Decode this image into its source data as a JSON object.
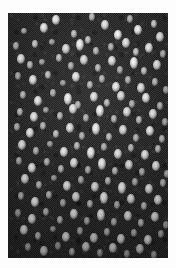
{
  "figure": {
    "kind": "micrograph",
    "caption": "",
    "canvas": {
      "width": 176,
      "height": 268
    },
    "page_background": "#fdfdfd",
    "field": {
      "x": 8,
      "y": 13,
      "width": 160,
      "height": 245,
      "background_color": "#242424",
      "texture": "dithered-halftone",
      "particle_color": "#ffffff",
      "particle_count": 152,
      "description": "Dark field scattered with small bright elliptical particles"
    }
  },
  "chart_data": {
    "type": "scatter",
    "title": "",
    "xlabel": "",
    "ylabel": "",
    "xlim": [
      0,
      160
    ],
    "ylim": [
      0,
      245
    ],
    "grid": false,
    "legend": null,
    "background": "#242424",
    "marker_color": "#ffffff",
    "note": "Positions are pixel coordinates within the dark imaged field; size is particle diameter in px; b is relative brightness 0-1.",
    "points": [
      {
        "x": 48,
        "y": 7,
        "w": 4,
        "h": 5,
        "b": 0.92
      },
      {
        "x": 84,
        "y": 4,
        "w": 3,
        "h": 4,
        "b": 0.7
      },
      {
        "x": 122,
        "y": 6,
        "w": 3,
        "h": 4,
        "b": 0.66
      },
      {
        "x": 16,
        "y": 18,
        "w": 3,
        "h": 3,
        "b": 0.62
      },
      {
        "x": 36,
        "y": 15,
        "w": 4,
        "h": 5,
        "b": 0.9
      },
      {
        "x": 66,
        "y": 21,
        "w": 3,
        "h": 4,
        "b": 0.72
      },
      {
        "x": 97,
        "y": 12,
        "w": 4,
        "h": 5,
        "b": 0.88
      },
      {
        "x": 110,
        "y": 22,
        "w": 4,
        "h": 5,
        "b": 0.95
      },
      {
        "x": 130,
        "y": 17,
        "w": 4,
        "h": 5,
        "b": 0.93
      },
      {
        "x": 146,
        "y": 11,
        "w": 3,
        "h": 4,
        "b": 0.76
      },
      {
        "x": 152,
        "y": 24,
        "w": 4,
        "h": 5,
        "b": 0.9
      },
      {
        "x": 8,
        "y": 33,
        "w": 3,
        "h": 4,
        "b": 0.68
      },
      {
        "x": 27,
        "y": 31,
        "w": 3,
        "h": 4,
        "b": 0.74
      },
      {
        "x": 44,
        "y": 29,
        "w": 3,
        "h": 3,
        "b": 0.58
      },
      {
        "x": 58,
        "y": 36,
        "w": 4,
        "h": 5,
        "b": 0.86
      },
      {
        "x": 72,
        "y": 32,
        "w": 4,
        "h": 6,
        "b": 0.94
      },
      {
        "x": 80,
        "y": 27,
        "w": 3,
        "h": 4,
        "b": 0.72
      },
      {
        "x": 88,
        "y": 38,
        "w": 3,
        "h": 4,
        "b": 0.7
      },
      {
        "x": 103,
        "y": 34,
        "w": 3,
        "h": 4,
        "b": 0.66
      },
      {
        "x": 118,
        "y": 30,
        "w": 4,
        "h": 5,
        "b": 0.88
      },
      {
        "x": 128,
        "y": 39,
        "w": 3,
        "h": 4,
        "b": 0.74
      },
      {
        "x": 141,
        "y": 35,
        "w": 4,
        "h": 5,
        "b": 0.9
      },
      {
        "x": 155,
        "y": 41,
        "w": 3,
        "h": 4,
        "b": 0.68
      },
      {
        "x": 13,
        "y": 46,
        "w": 4,
        "h": 5,
        "b": 0.92
      },
      {
        "x": 22,
        "y": 52,
        "w": 3,
        "h": 4,
        "b": 0.7
      },
      {
        "x": 34,
        "y": 49,
        "w": 3,
        "h": 3,
        "b": 0.6
      },
      {
        "x": 51,
        "y": 45,
        "w": 3,
        "h": 4,
        "b": 0.72
      },
      {
        "x": 63,
        "y": 53,
        "w": 3,
        "h": 4,
        "b": 0.66
      },
      {
        "x": 76,
        "y": 47,
        "w": 4,
        "h": 5,
        "b": 0.86
      },
      {
        "x": 90,
        "y": 55,
        "w": 3,
        "h": 4,
        "b": 0.7
      },
      {
        "x": 104,
        "y": 48,
        "w": 4,
        "h": 5,
        "b": 0.88
      },
      {
        "x": 112,
        "y": 57,
        "w": 3,
        "h": 4,
        "b": 0.64
      },
      {
        "x": 126,
        "y": 50,
        "w": 4,
        "h": 6,
        "b": 0.95
      },
      {
        "x": 136,
        "y": 58,
        "w": 3,
        "h": 4,
        "b": 0.72
      },
      {
        "x": 149,
        "y": 52,
        "w": 4,
        "h": 5,
        "b": 0.9
      },
      {
        "x": 10,
        "y": 63,
        "w": 3,
        "h": 4,
        "b": 0.66
      },
      {
        "x": 25,
        "y": 67,
        "w": 4,
        "h": 5,
        "b": 0.88
      },
      {
        "x": 40,
        "y": 62,
        "w": 3,
        "h": 4,
        "b": 0.72
      },
      {
        "x": 55,
        "y": 70,
        "w": 3,
        "h": 3,
        "b": 0.58
      },
      {
        "x": 68,
        "y": 64,
        "w": 4,
        "h": 5,
        "b": 0.9
      },
      {
        "x": 82,
        "y": 72,
        "w": 3,
        "h": 4,
        "b": 0.7
      },
      {
        "x": 94,
        "y": 66,
        "w": 3,
        "h": 4,
        "b": 0.68
      },
      {
        "x": 108,
        "y": 74,
        "w": 4,
        "h": 5,
        "b": 0.92
      },
      {
        "x": 120,
        "y": 67,
        "w": 3,
        "h": 4,
        "b": 0.66
      },
      {
        "x": 133,
        "y": 75,
        "w": 4,
        "h": 5,
        "b": 0.86
      },
      {
        "x": 147,
        "y": 69,
        "w": 3,
        "h": 4,
        "b": 0.7
      },
      {
        "x": 158,
        "y": 77,
        "w": 3,
        "h": 4,
        "b": 0.64
      },
      {
        "x": 15,
        "y": 82,
        "w": 3,
        "h": 4,
        "b": 0.7
      },
      {
        "x": 30,
        "y": 88,
        "w": 4,
        "h": 5,
        "b": 0.9
      },
      {
        "x": 45,
        "y": 80,
        "w": 3,
        "h": 4,
        "b": 0.66
      },
      {
        "x": 60,
        "y": 86,
        "w": 4,
        "h": 6,
        "b": 0.94
      },
      {
        "x": 70,
        "y": 92,
        "w": 3,
        "h": 4,
        "b": 0.68
      },
      {
        "x": 86,
        "y": 84,
        "w": 4,
        "h": 5,
        "b": 0.88
      },
      {
        "x": 99,
        "y": 90,
        "w": 3,
        "h": 4,
        "b": 0.7
      },
      {
        "x": 113,
        "y": 83,
        "w": 4,
        "h": 5,
        "b": 0.86
      },
      {
        "x": 124,
        "y": 91,
        "w": 3,
        "h": 4,
        "b": 0.64
      },
      {
        "x": 138,
        "y": 85,
        "w": 4,
        "h": 5,
        "b": 0.9
      },
      {
        "x": 152,
        "y": 93,
        "w": 3,
        "h": 4,
        "b": 0.68
      },
      {
        "x": 12,
        "y": 99,
        "w": 3,
        "h": 4,
        "b": 0.72
      },
      {
        "x": 26,
        "y": 104,
        "w": 4,
        "h": 5,
        "b": 0.88
      },
      {
        "x": 38,
        "y": 97,
        "w": 3,
        "h": 3,
        "b": 0.58
      },
      {
        "x": 52,
        "y": 103,
        "w": 3,
        "h": 4,
        "b": 0.7
      },
      {
        "x": 65,
        "y": 96,
        "w": 4,
        "h": 5,
        "b": 0.9
      },
      {
        "x": 78,
        "y": 105,
        "w": 3,
        "h": 4,
        "b": 0.66
      },
      {
        "x": 92,
        "y": 98,
        "w": 4,
        "h": 6,
        "b": 0.95
      },
      {
        "x": 106,
        "y": 106,
        "w": 3,
        "h": 4,
        "b": 0.68
      },
      {
        "x": 119,
        "y": 99,
        "w": 4,
        "h": 5,
        "b": 0.86
      },
      {
        "x": 131,
        "y": 107,
        "w": 3,
        "h": 4,
        "b": 0.7
      },
      {
        "x": 145,
        "y": 101,
        "w": 4,
        "h": 5,
        "b": 0.88
      },
      {
        "x": 157,
        "y": 109,
        "w": 3,
        "h": 4,
        "b": 0.62
      },
      {
        "x": 9,
        "y": 114,
        "w": 3,
        "h": 4,
        "b": 0.66
      },
      {
        "x": 22,
        "y": 120,
        "w": 4,
        "h": 5,
        "b": 0.9
      },
      {
        "x": 35,
        "y": 113,
        "w": 3,
        "h": 4,
        "b": 0.68
      },
      {
        "x": 48,
        "y": 121,
        "w": 3,
        "h": 4,
        "b": 0.72
      },
      {
        "x": 62,
        "y": 115,
        "w": 4,
        "h": 5,
        "b": 0.88
      },
      {
        "x": 74,
        "y": 123,
        "w": 3,
        "h": 4,
        "b": 0.64
      },
      {
        "x": 88,
        "y": 116,
        "w": 4,
        "h": 6,
        "b": 0.93
      },
      {
        "x": 101,
        "y": 124,
        "w": 3,
        "h": 4,
        "b": 0.7
      },
      {
        "x": 115,
        "y": 117,
        "w": 4,
        "h": 5,
        "b": 0.86
      },
      {
        "x": 128,
        "y": 125,
        "w": 3,
        "h": 4,
        "b": 0.66
      },
      {
        "x": 142,
        "y": 118,
        "w": 4,
        "h": 5,
        "b": 0.9
      },
      {
        "x": 154,
        "y": 126,
        "w": 3,
        "h": 4,
        "b": 0.68
      },
      {
        "x": 14,
        "y": 132,
        "w": 4,
        "h": 5,
        "b": 0.88
      },
      {
        "x": 28,
        "y": 138,
        "w": 3,
        "h": 4,
        "b": 0.66
      },
      {
        "x": 42,
        "y": 131,
        "w": 3,
        "h": 3,
        "b": 0.58
      },
      {
        "x": 56,
        "y": 139,
        "w": 4,
        "h": 5,
        "b": 0.9
      },
      {
        "x": 69,
        "y": 133,
        "w": 3,
        "h": 4,
        "b": 0.7
      },
      {
        "x": 83,
        "y": 140,
        "w": 4,
        "h": 6,
        "b": 0.94
      },
      {
        "x": 96,
        "y": 134,
        "w": 3,
        "h": 4,
        "b": 0.66
      },
      {
        "x": 110,
        "y": 141,
        "w": 4,
        "h": 5,
        "b": 0.88
      },
      {
        "x": 123,
        "y": 135,
        "w": 3,
        "h": 4,
        "b": 0.68
      },
      {
        "x": 137,
        "y": 142,
        "w": 4,
        "h": 5,
        "b": 0.86
      },
      {
        "x": 150,
        "y": 136,
        "w": 3,
        "h": 4,
        "b": 0.7
      },
      {
        "x": 11,
        "y": 148,
        "w": 3,
        "h": 4,
        "b": 0.64
      },
      {
        "x": 24,
        "y": 155,
        "w": 4,
        "h": 5,
        "b": 0.9
      },
      {
        "x": 39,
        "y": 149,
        "w": 3,
        "h": 4,
        "b": 0.68
      },
      {
        "x": 53,
        "y": 156,
        "w": 3,
        "h": 4,
        "b": 0.7
      },
      {
        "x": 66,
        "y": 150,
        "w": 4,
        "h": 5,
        "b": 0.88
      },
      {
        "x": 80,
        "y": 157,
        "w": 3,
        "h": 4,
        "b": 0.66
      },
      {
        "x": 94,
        "y": 151,
        "w": 4,
        "h": 6,
        "b": 0.93
      },
      {
        "x": 107,
        "y": 158,
        "w": 3,
        "h": 4,
        "b": 0.7
      },
      {
        "x": 121,
        "y": 152,
        "w": 4,
        "h": 5,
        "b": 0.86
      },
      {
        "x": 134,
        "y": 159,
        "w": 3,
        "h": 4,
        "b": 0.64
      },
      {
        "x": 148,
        "y": 153,
        "w": 4,
        "h": 5,
        "b": 0.9
      },
      {
        "x": 159,
        "y": 161,
        "w": 3,
        "h": 4,
        "b": 0.66
      },
      {
        "x": 17,
        "y": 166,
        "w": 4,
        "h": 5,
        "b": 0.88
      },
      {
        "x": 31,
        "y": 172,
        "w": 3,
        "h": 4,
        "b": 0.68
      },
      {
        "x": 46,
        "y": 165,
        "w": 3,
        "h": 3,
        "b": 0.58
      },
      {
        "x": 59,
        "y": 173,
        "w": 4,
        "h": 5,
        "b": 0.9
      },
      {
        "x": 73,
        "y": 167,
        "w": 3,
        "h": 4,
        "b": 0.66
      },
      {
        "x": 87,
        "y": 174,
        "w": 4,
        "h": 5,
        "b": 0.86
      },
      {
        "x": 100,
        "y": 168,
        "w": 3,
        "h": 4,
        "b": 0.7
      },
      {
        "x": 114,
        "y": 175,
        "w": 4,
        "h": 6,
        "b": 0.92
      },
      {
        "x": 127,
        "y": 169,
        "w": 3,
        "h": 4,
        "b": 0.64
      },
      {
        "x": 141,
        "y": 176,
        "w": 4,
        "h": 5,
        "b": 0.88
      },
      {
        "x": 155,
        "y": 170,
        "w": 3,
        "h": 4,
        "b": 0.68
      },
      {
        "x": 13,
        "y": 183,
        "w": 3,
        "h": 4,
        "b": 0.66
      },
      {
        "x": 27,
        "y": 189,
        "w": 4,
        "h": 5,
        "b": 0.9
      },
      {
        "x": 41,
        "y": 182,
        "w": 3,
        "h": 4,
        "b": 0.68
      },
      {
        "x": 55,
        "y": 190,
        "w": 3,
        "h": 4,
        "b": 0.64
      },
      {
        "x": 68,
        "y": 184,
        "w": 4,
        "h": 5,
        "b": 0.86
      },
      {
        "x": 82,
        "y": 191,
        "w": 3,
        "h": 4,
        "b": 0.7
      },
      {
        "x": 96,
        "y": 185,
        "w": 4,
        "h": 6,
        "b": 0.93
      },
      {
        "x": 109,
        "y": 192,
        "w": 3,
        "h": 4,
        "b": 0.66
      },
      {
        "x": 123,
        "y": 186,
        "w": 4,
        "h": 5,
        "b": 0.88
      },
      {
        "x": 136,
        "y": 193,
        "w": 3,
        "h": 4,
        "b": 0.68
      },
      {
        "x": 150,
        "y": 187,
        "w": 4,
        "h": 5,
        "b": 0.9
      },
      {
        "x": 10,
        "y": 200,
        "w": 3,
        "h": 4,
        "b": 0.62
      },
      {
        "x": 24,
        "y": 206,
        "w": 4,
        "h": 5,
        "b": 0.86
      },
      {
        "x": 38,
        "y": 199,
        "w": 3,
        "h": 4,
        "b": 0.66
      },
      {
        "x": 52,
        "y": 207,
        "w": 3,
        "h": 4,
        "b": 0.68
      },
      {
        "x": 66,
        "y": 201,
        "w": 4,
        "h": 5,
        "b": 0.88
      },
      {
        "x": 79,
        "y": 208,
        "w": 3,
        "h": 4,
        "b": 0.64
      },
      {
        "x": 93,
        "y": 202,
        "w": 4,
        "h": 6,
        "b": 0.92
      },
      {
        "x": 106,
        "y": 209,
        "w": 3,
        "h": 4,
        "b": 0.66
      },
      {
        "x": 120,
        "y": 203,
        "w": 4,
        "h": 5,
        "b": 0.86
      },
      {
        "x": 133,
        "y": 210,
        "w": 3,
        "h": 4,
        "b": 0.7
      },
      {
        "x": 147,
        "y": 204,
        "w": 4,
        "h": 5,
        "b": 0.88
      },
      {
        "x": 158,
        "y": 212,
        "w": 3,
        "h": 4,
        "b": 0.62
      },
      {
        "x": 16,
        "y": 217,
        "w": 4,
        "h": 5,
        "b": 0.88
      },
      {
        "x": 30,
        "y": 223,
        "w": 3,
        "h": 4,
        "b": 0.66
      },
      {
        "x": 45,
        "y": 216,
        "w": 3,
        "h": 3,
        "b": 0.56
      },
      {
        "x": 58,
        "y": 224,
        "w": 4,
        "h": 5,
        "b": 0.86
      },
      {
        "x": 72,
        "y": 218,
        "w": 3,
        "h": 4,
        "b": 0.64
      },
      {
        "x": 86,
        "y": 225,
        "w": 4,
        "h": 5,
        "b": 0.84
      },
      {
        "x": 99,
        "y": 219,
        "w": 3,
        "h": 4,
        "b": 0.66
      },
      {
        "x": 113,
        "y": 226,
        "w": 4,
        "h": 5,
        "b": 0.88
      },
      {
        "x": 126,
        "y": 220,
        "w": 3,
        "h": 4,
        "b": 0.62
      },
      {
        "x": 140,
        "y": 227,
        "w": 4,
        "h": 5,
        "b": 0.86
      },
      {
        "x": 153,
        "y": 221,
        "w": 3,
        "h": 4,
        "b": 0.64
      },
      {
        "x": 20,
        "y": 234,
        "w": 3,
        "h": 4,
        "b": 0.62
      },
      {
        "x": 36,
        "y": 238,
        "w": 4,
        "h": 5,
        "b": 0.8
      },
      {
        "x": 50,
        "y": 233,
        "w": 3,
        "h": 4,
        "b": 0.58
      },
      {
        "x": 64,
        "y": 239,
        "w": 3,
        "h": 4,
        "b": 0.66
      },
      {
        "x": 78,
        "y": 234,
        "w": 4,
        "h": 5,
        "b": 0.82
      },
      {
        "x": 92,
        "y": 240,
        "w": 3,
        "h": 4,
        "b": 0.6
      },
      {
        "x": 105,
        "y": 235,
        "w": 4,
        "h": 5,
        "b": 0.84
      },
      {
        "x": 119,
        "y": 241,
        "w": 3,
        "h": 4,
        "b": 0.58
      },
      {
        "x": 132,
        "y": 236,
        "w": 4,
        "h": 5,
        "b": 0.8
      },
      {
        "x": 146,
        "y": 242,
        "w": 3,
        "h": 4,
        "b": 0.62
      }
    ]
  }
}
